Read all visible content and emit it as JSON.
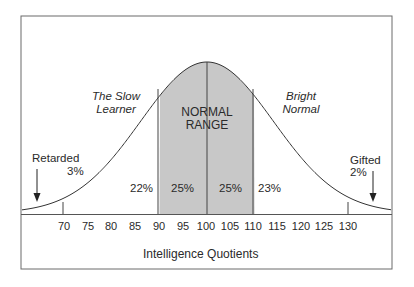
{
  "chart_data": {
    "type": "area",
    "title": "",
    "xlabel": "Intelligence Quotients",
    "ylabel": "",
    "distribution": "normal",
    "mean": 100,
    "std_dev": 15,
    "x_ticks": [
      70,
      75,
      80,
      85,
      90,
      95,
      100,
      105,
      110,
      115,
      120,
      125,
      130
    ],
    "xlim": [
      61,
      140
    ],
    "grid": false,
    "shaded_region": {
      "from": 90,
      "to": 110,
      "label": "NORMAL RANGE",
      "color": "#c8c8c8"
    },
    "region_markers": [
      70,
      100,
      130
    ],
    "segments": [
      {
        "range": "below 70",
        "label": "Retarded",
        "percent": "3%"
      },
      {
        "range": "70-90",
        "label": "The Slow Learner",
        "percent": "22%"
      },
      {
        "range": "90-100",
        "label": "NORMAL RANGE",
        "percent": "25%"
      },
      {
        "range": "100-110",
        "label": "NORMAL RANGE",
        "percent": "25%"
      },
      {
        "range": "110-130",
        "label": "Bright Normal",
        "percent": "23%"
      },
      {
        "range": "above 130",
        "label": "Gifted",
        "percent": "2%"
      }
    ]
  },
  "labels": {
    "slow_learner_line1": "The Slow",
    "slow_learner_line2": "Learner",
    "bright_normal_line1": "Bright",
    "bright_normal_line2": "Normal",
    "normal_range_line1": "NORMAL",
    "normal_range_line2": "RANGE",
    "retarded": "Retarded",
    "retarded_pct": "3%",
    "gifted": "Gifted",
    "gifted_pct": "2%",
    "pct_slow": "22%",
    "pct_normal_low": "25%",
    "pct_normal_high": "25%",
    "pct_bright": "23%",
    "xlabel": "Intelligence Quotients"
  },
  "ticks": [
    "70",
    "75",
    "80",
    "85",
    "90",
    "95",
    "100",
    "105",
    "110",
    "115",
    "120",
    "125",
    "130"
  ],
  "colors": {
    "shade": "#c8c8c8",
    "line": "#333333",
    "frame": "#6a6a6a"
  }
}
